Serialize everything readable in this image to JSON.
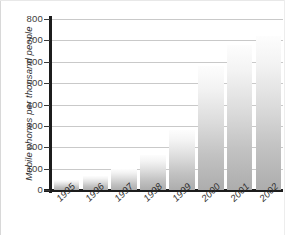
{
  "chart_data": {
    "type": "bar",
    "title": "",
    "xlabel": "",
    "ylabel": "Mobile phones per thousand people",
    "categories": [
      "1995",
      "1996",
      "1997",
      "1998",
      "1999",
      "2000",
      "2001",
      "2002"
    ],
    "values": [
      45,
      65,
      100,
      165,
      280,
      580,
      680,
      720
    ],
    "ylim": [
      0,
      800
    ],
    "ytick_labels": [
      "800",
      "700",
      "600",
      "500",
      "400",
      "300",
      "200",
      "100",
      "0"
    ],
    "ytick_values": [
      800,
      700,
      600,
      500,
      400,
      300,
      200,
      100,
      0
    ],
    "grid": true,
    "legend": "none",
    "bar_fill": "#d2d2d2",
    "axis_color": "#1c1c1c",
    "gridline_color": "#c9c9c9",
    "background": "#ffffff"
  }
}
